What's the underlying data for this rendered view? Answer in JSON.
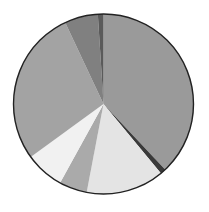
{
  "chart_data": {
    "type": "pie",
    "title": "",
    "legend": "none",
    "start_angle_deg": 0,
    "direction": "clockwise",
    "slices": [
      {
        "label": "",
        "value": 38,
        "color": "#9a9a9a"
      },
      {
        "label": "",
        "value": 1,
        "color": "#3a3a3a"
      },
      {
        "label": "",
        "value": 14,
        "color": "#e4e4e4"
      },
      {
        "label": "",
        "value": 5,
        "color": "#aaaaaa"
      },
      {
        "label": "",
        "value": 7,
        "color": "#f1f1f1"
      },
      {
        "label": "",
        "value": 28,
        "color": "#a3a3a3"
      },
      {
        "label": "",
        "value": 6,
        "color": "#808080"
      },
      {
        "label": "",
        "value": 1,
        "color": "#5a5a5a"
      }
    ],
    "values": [
      38,
      1,
      14,
      5,
      7,
      28,
      6,
      1
    ]
  }
}
